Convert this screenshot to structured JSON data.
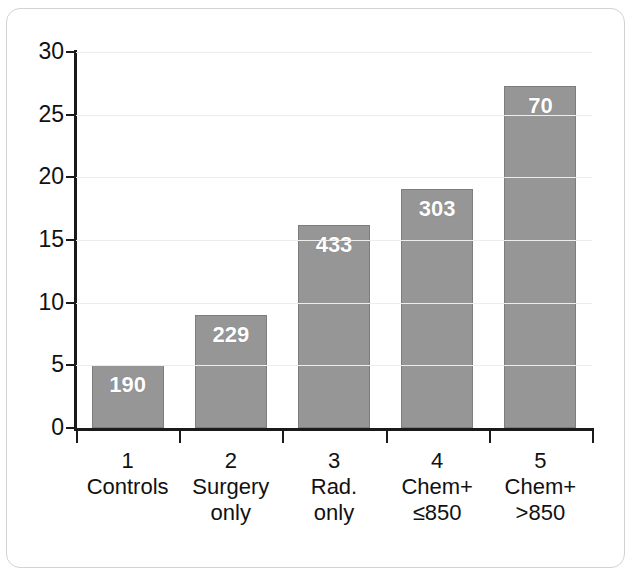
{
  "chart_data": {
    "type": "bar",
    "title": "",
    "subtitle": "",
    "xlabel": "",
    "ylabel": "",
    "ylim": [
      0,
      30
    ],
    "yticks": [
      0,
      5,
      10,
      15,
      20,
      25,
      30
    ],
    "ytick_labels": [
      "0",
      "5",
      "10",
      "15",
      "20",
      "25",
      "30"
    ],
    "grid": true,
    "legend": "none",
    "categories": [
      "Controls",
      "Surgery only",
      "Rad. only",
      "Chem+ ≤850",
      "Chem+ >850"
    ],
    "category_numbers": [
      "1",
      "2",
      "3",
      "4",
      "5"
    ],
    "values": [
      5.0,
      9.0,
      16.2,
      19.1,
      27.3
    ],
    "point_labels": [
      "190",
      "229",
      "433",
      "303",
      "70"
    ],
    "bar_color": "#969696",
    "bar_border_color": "#7d7d7d",
    "label_color": "#ffffff",
    "axis_color": "#1a1a1a",
    "gridline_color": "#ededed"
  },
  "axis": {
    "y": {
      "ticks": [
        {
          "label": "30",
          "value": 30
        },
        {
          "label": "25",
          "value": 25
        },
        {
          "label": "20",
          "value": 20
        },
        {
          "label": "15",
          "value": 15
        },
        {
          "label": "10",
          "value": 10
        },
        {
          "label": "5",
          "value": 5
        },
        {
          "label": "0",
          "value": 0
        }
      ]
    },
    "x": {
      "categories": [
        {
          "number": "1",
          "line1": "Controls",
          "line2": ""
        },
        {
          "number": "2",
          "line1": "Surgery",
          "line2": "only"
        },
        {
          "number": "3",
          "line1": "Rad.",
          "line2": "only"
        },
        {
          "number": "4",
          "line1": "Chem+",
          "line2": "≤850"
        },
        {
          "number": "5",
          "line1": "Chem+",
          "line2": ">850"
        }
      ]
    }
  },
  "bars": [
    {
      "value": 5.0,
      "label": "190"
    },
    {
      "value": 9.0,
      "label": "229"
    },
    {
      "value": 16.2,
      "label": "433"
    },
    {
      "value": 19.1,
      "label": "303"
    },
    {
      "value": 27.3,
      "label": "70"
    }
  ]
}
